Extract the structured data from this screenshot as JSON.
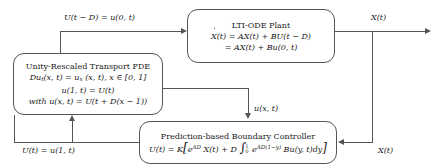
{
  "diagram": {
    "line_color": "#555555",
    "background": "#ffffff"
  },
  "blocks": {
    "plant": {
      "name": "LTI-ODE Plant",
      "title": "LTI-ODE Plant",
      "equation_line1": "Ẋ(t) = AX(t) + BU(t − D)",
      "equation_line2": "= AX(t) + Bu(0, t)"
    },
    "pde": {
      "name": "Unity-Rescaled Transport PDE",
      "title": "Unity-Rescaled Transport PDE",
      "equation_line1": "Du_t(x, t) = u_x (x, t), x ∈ [0, 1]",
      "equation_line2": "u(1, t) = U(t)",
      "equation_line3": "with u(x, t) = U(t + D(x − 1))"
    },
    "controller": {
      "name": "Prediction-based Boundary Controller",
      "title": "Prediction-based Boundary Controller",
      "equation": "U(t) = K[ e^{AD} X(t) + D ∫₀¹ e^{AD(1−y)} Bu(y, t)dy ]"
    }
  },
  "edge_labels": {
    "pde_to_plant": "U(t − D) = u(0, t)",
    "plant_output": "X(t)",
    "pde_to_controller": "u(x, t)",
    "plant_to_controller": "X(t)",
    "controller_to_pde": "U(t) = u(1, t)"
  }
}
